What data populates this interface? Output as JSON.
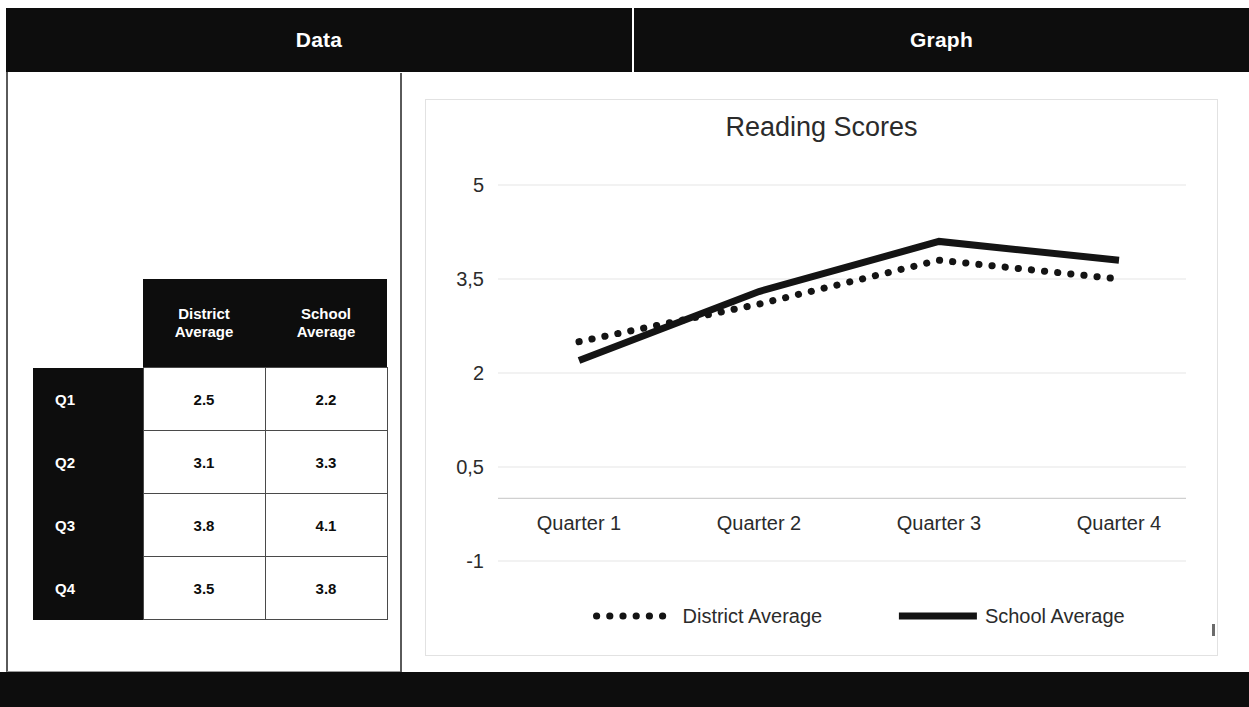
{
  "slide": {
    "headers": [
      {
        "name": "data",
        "label": "Data"
      },
      {
        "name": "graph",
        "label": "Graph"
      }
    ],
    "accent_color": "#0d0d0d",
    "background_color": "#ffffff"
  },
  "table": {
    "corner_label": "",
    "column_headers": [
      "District Average",
      "School Average"
    ],
    "column_headers_wrapped": [
      {
        "line1": "District",
        "line2": "Average"
      },
      {
        "line1": "School",
        "line2": "Average"
      }
    ],
    "row_headers": [
      "Q1",
      "Q2",
      "Q3",
      "Q4"
    ],
    "rows": [
      {
        "label": "Q1",
        "district": "2.5",
        "school": "2.2"
      },
      {
        "label": "Q2",
        "district": "3.1",
        "school": "3.3"
      },
      {
        "label": "Q3",
        "district": "3.8",
        "school": "4.1"
      },
      {
        "label": "Q4",
        "district": "3.5",
        "school": "3.8"
      }
    ]
  },
  "chart_data": {
    "type": "line",
    "title": "Reading Scores",
    "xlabel": "",
    "ylabel": "",
    "categories": [
      "Quarter 1",
      "Quarter 2",
      "Quarter 3",
      "Quarter 4"
    ],
    "series": [
      {
        "name": "District Average",
        "values": [
          2.5,
          3.1,
          3.8,
          3.5
        ],
        "style": "dotted",
        "color": "#141414"
      },
      {
        "name": "School Average",
        "values": [
          2.2,
          3.3,
          4.1,
          3.8
        ],
        "style": "solid",
        "color": "#141414"
      }
    ],
    "ylim": [
      -1,
      5
    ],
    "yticks": [
      5,
      3.5,
      2,
      0.5,
      -1
    ],
    "ytick_labels": [
      "5",
      "3,5",
      "2",
      "0,5",
      "-1"
    ],
    "grid": true,
    "legend_position": "bottom",
    "legend": [
      "District Average",
      "School Average"
    ]
  }
}
